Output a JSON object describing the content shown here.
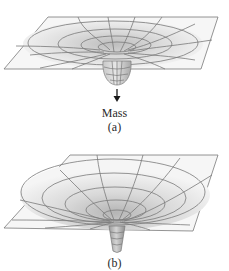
{
  "figure": {
    "panel_a": {
      "object_label": "Mass",
      "caption": "(a)",
      "arrow": "down-arrow"
    },
    "panel_b": {
      "caption": "(b)"
    },
    "colors": {
      "grid_line": "#7a7a7a",
      "surface_light": "#f2f2f2",
      "surface_dark": "#c4c4c4",
      "text": "#2a2a2a"
    }
  }
}
